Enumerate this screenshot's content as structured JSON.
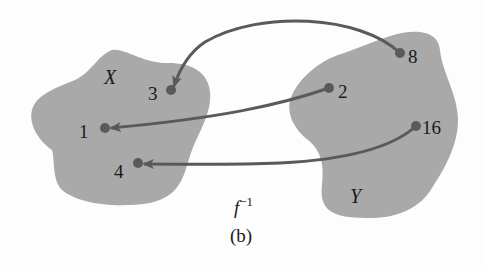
{
  "diagram": {
    "caption": "(b)",
    "function_label": {
      "base": "f",
      "superscript": "−1"
    },
    "colors": {
      "blob": "#a9a9a9",
      "arrow": "#5a5a5a",
      "point": "#5a5a5a",
      "text": "#1a1a1a"
    },
    "sets": [
      {
        "name": "X",
        "points": [
          "3",
          "1",
          "4"
        ]
      },
      {
        "name": "Y",
        "points": [
          "8",
          "2",
          "16"
        ]
      }
    ],
    "mapping": [
      {
        "from": "8",
        "to": "3"
      },
      {
        "from": "2",
        "to": "1"
      },
      {
        "from": "16",
        "to": "4"
      }
    ],
    "labels": {
      "set_x": "X",
      "set_y": "Y",
      "x_points": {
        "p3": "3",
        "p1": "1",
        "p4": "4"
      },
      "y_points": {
        "p8": "8",
        "p2": "2",
        "p16": "16"
      }
    }
  }
}
